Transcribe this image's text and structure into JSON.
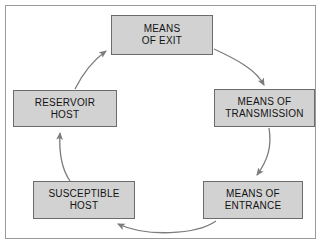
{
  "diagram": {
    "background_color": "#ffffff",
    "frame_border_color": "#9a9a9a",
    "node_fill_color": "#d2d2d2",
    "node_border_color": "#6b6b6b",
    "arrow_color": "#7c7c7c",
    "text_color": "#131313",
    "flow_direction": "clockwise",
    "nodes": [
      {
        "id": "exit",
        "line1": "MEANS",
        "line2": "OF EXIT"
      },
      {
        "id": "transmission",
        "line1": "MEANS OF",
        "line2": "TRANSMISSION"
      },
      {
        "id": "entrance",
        "line1": "MEANS OF",
        "line2": "ENTRANCE"
      },
      {
        "id": "susceptible",
        "line1": "SUSCEPTIBLE",
        "line2": "HOST"
      },
      {
        "id": "reservoir",
        "line1": "RESERVOIR",
        "line2": "HOST"
      }
    ],
    "edges": [
      {
        "from": "exit",
        "to": "transmission"
      },
      {
        "from": "transmission",
        "to": "entrance"
      },
      {
        "from": "entrance",
        "to": "susceptible"
      },
      {
        "from": "susceptible",
        "to": "reservoir"
      },
      {
        "from": "reservoir",
        "to": "exit"
      }
    ]
  }
}
